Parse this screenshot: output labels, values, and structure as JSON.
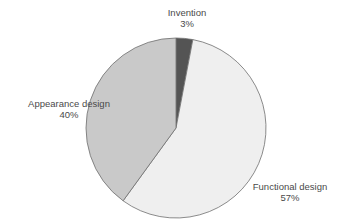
{
  "chart_data": {
    "type": "pie",
    "title": "",
    "categories": [
      "Invention",
      "Functional design",
      "Appearance design"
    ],
    "values": [
      3,
      57,
      40
    ],
    "unit": "%",
    "colors": [
      "#545454",
      "#efefef",
      "#c9c9c9"
    ],
    "stroke": "#6e6e6e",
    "start_angle_deg": 0,
    "direction": "clockwise",
    "labels": [
      {
        "name": "Invention",
        "value": "3%"
      },
      {
        "name": "Functional design",
        "value": "57%"
      },
      {
        "name": "Appearance design",
        "value": "40%"
      }
    ],
    "legend": "none (direct labels)"
  }
}
